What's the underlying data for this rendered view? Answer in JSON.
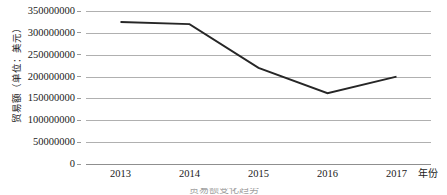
{
  "chart_data": {
    "type": "line",
    "title": "",
    "xlabel": "年份",
    "ylabel": "贸易额（单位：美元）",
    "categories": [
      "2013",
      "2014",
      "2015",
      "2016",
      "2017"
    ],
    "values": [
      325000000,
      320000000,
      220000000,
      162000000,
      200000000
    ],
    "series": [
      {
        "name": "贸易额",
        "values": [
          325000000,
          320000000,
          220000000,
          162000000,
          200000000
        ]
      }
    ],
    "ylim": [
      0,
      350000000
    ],
    "ytick_values": [
      0,
      50000000,
      100000000,
      150000000,
      200000000,
      250000000,
      300000000,
      350000000
    ],
    "ytick_labels": [
      "0",
      "50000000",
      "100000000",
      "150000000",
      "200000000",
      "250000000",
      "300000000",
      "350000000"
    ],
    "xtick_labels": [
      "2013",
      "2014",
      "2015",
      "2016",
      "2017"
    ],
    "grid": "horizontal",
    "legend": "none",
    "line_color": "#262626",
    "gridline_color": "#b0b0b0",
    "markers": "none"
  },
  "caption": {
    "text": "贸易额变化趋势"
  }
}
